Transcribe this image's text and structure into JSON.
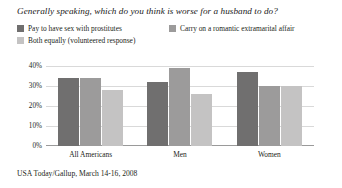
{
  "chart_data": {
    "type": "bar",
    "title": "Generally speaking, which do you think is worse for a husband to do?",
    "xlabel": "",
    "ylabel": "",
    "ylim": [
      0,
      40
    ],
    "yticks": [
      0,
      10,
      20,
      30,
      40
    ],
    "ytick_labels": [
      "0%",
      "10%",
      "20%",
      "30%",
      "40%"
    ],
    "grid": true,
    "legend_position": "top-left",
    "categories": [
      "All Americans",
      "Men",
      "Women"
    ],
    "series": [
      {
        "name": "Pay to have sex with prostitutes",
        "color": "#706f6f",
        "values": [
          34,
          32,
          37
        ]
      },
      {
        "name": "Carry on a romantic extramarital affair",
        "color": "#9c9b9b",
        "values": [
          34,
          39,
          30
        ]
      },
      {
        "name": "Both equally (volunteered response)",
        "color": "#c4c3c3",
        "values": [
          28,
          26,
          30
        ]
      }
    ],
    "source": "USA Today/Gallup, March 14-16, 2008"
  },
  "colors": {
    "background": "#ffffff",
    "gridline": "#d9d9d9",
    "axis": "#9a9a9a",
    "text": "#231f20"
  }
}
